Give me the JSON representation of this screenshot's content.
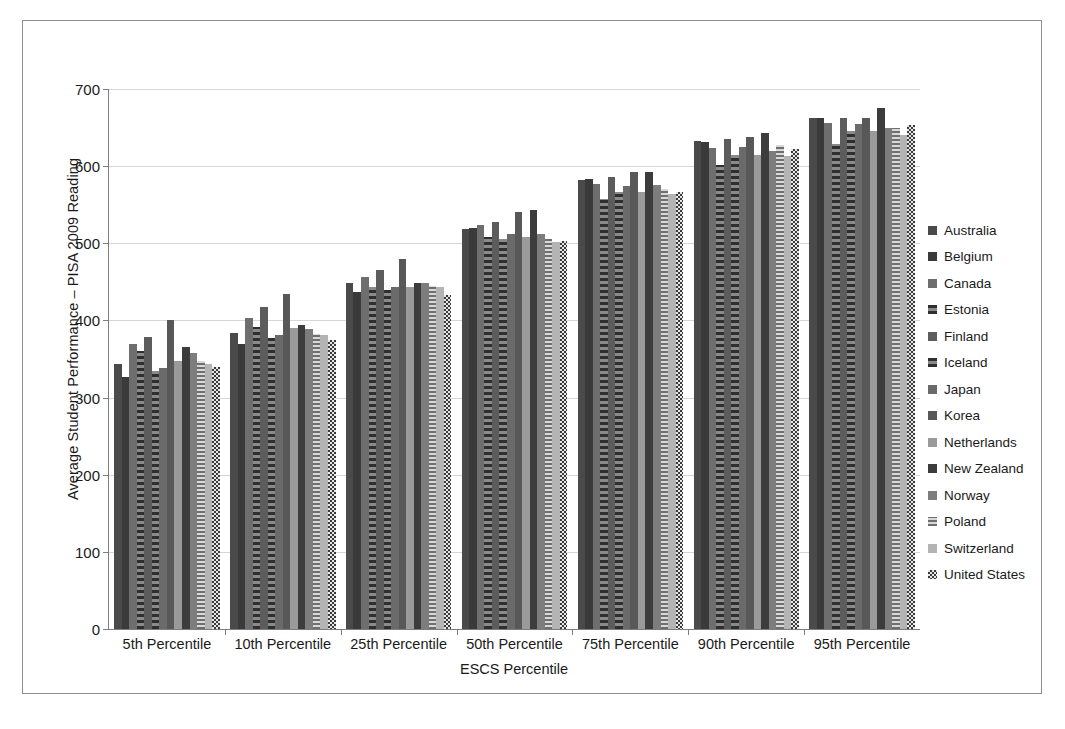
{
  "chart_data": {
    "type": "bar",
    "title": "",
    "xlabel": "ESCS Percentile",
    "ylabel": "Average Student Performance – PISA 2009 Reading",
    "ylim": [
      0,
      700
    ],
    "ytick_step": 100,
    "yticks": [
      "700",
      "600",
      "500",
      "400",
      "300",
      "200",
      "100",
      "0"
    ],
    "grid": true,
    "legend_position": "right",
    "categories": [
      "5th Percentile",
      "10th Percentile",
      "25th Percentile",
      "50th Percentile",
      "75th Percentile",
      "90th Percentile",
      "95th Percentile"
    ],
    "series": [
      {
        "name": "Australia",
        "color": "#4a4a4a",
        "pattern": "solid",
        "values": [
          343,
          384,
          448,
          518,
          582,
          632,
          662
        ]
      },
      {
        "name": "Belgium",
        "color": "#3a3a3a",
        "pattern": "solid",
        "values": [
          327,
          370,
          437,
          520,
          583,
          631,
          663
        ]
      },
      {
        "name": "Canada",
        "color": "#6e6e6e",
        "pattern": "solid",
        "values": [
          370,
          403,
          456,
          524,
          577,
          624,
          656
        ]
      },
      {
        "name": "Estonia",
        "color": "#3f3f3f",
        "pattern": "vdash",
        "values": [
          360,
          392,
          444,
          508,
          558,
          601,
          629
        ]
      },
      {
        "name": "Finland",
        "color": "#5c5c5c",
        "pattern": "solid",
        "values": [
          378,
          418,
          465,
          528,
          586,
          635,
          663
        ]
      },
      {
        "name": "Iceland",
        "color": "#4f4f4f",
        "pattern": "vdash",
        "values": [
          334,
          377,
          440,
          506,
          566,
          615,
          646
        ]
      },
      {
        "name": "Japan",
        "color": "#6a6a6a",
        "pattern": "solid",
        "values": [
          338,
          381,
          444,
          512,
          574,
          625,
          655
        ]
      },
      {
        "name": "Korea",
        "color": "#585858",
        "pattern": "solid",
        "values": [
          400,
          434,
          480,
          540,
          592,
          638,
          663
        ]
      },
      {
        "name": "Netherlands",
        "color": "#9a9a9a",
        "pattern": "solid",
        "values": [
          348,
          390,
          443,
          508,
          566,
          614,
          646
        ]
      },
      {
        "name": "New Zealand",
        "color": "#3c3c3c",
        "pattern": "solid",
        "values": [
          366,
          394,
          449,
          543,
          592,
          643,
          675
        ]
      },
      {
        "name": "Norway",
        "color": "#7d7d7d",
        "pattern": "solid",
        "values": [
          358,
          389,
          448,
          512,
          575,
          620,
          649
        ]
      },
      {
        "name": "Poland",
        "color": "#8c8c8c",
        "pattern": "hstripe",
        "values": [
          347,
          382,
          445,
          505,
          570,
          627,
          650
        ]
      },
      {
        "name": "Switzerland",
        "color": "#b4b4b4",
        "pattern": "solid",
        "values": [
          344,
          381,
          444,
          502,
          564,
          613,
          640
        ]
      },
      {
        "name": "United States",
        "color": "#4b4b4b",
        "pattern": "check",
        "values": [
          340,
          375,
          433,
          503,
          567,
          622,
          653
        ]
      }
    ]
  }
}
